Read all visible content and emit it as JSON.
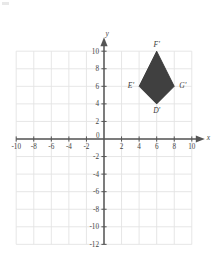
{
  "figure": {
    "corner_mark": "",
    "axes": {
      "x_axis_label": "x",
      "y_axis_label": "y",
      "origin_label": "0",
      "x_ticks": [
        -10,
        -8,
        -6,
        -4,
        -2,
        2,
        4,
        6,
        8,
        10
      ],
      "x_tick_labels": [
        "-10",
        "-8",
        "-6",
        "-4",
        "-2",
        "2",
        "4",
        "6",
        "8",
        "10"
      ],
      "y_ticks": [
        10,
        8,
        6,
        4,
        2,
        -2,
        -4,
        -6,
        -8,
        -10,
        -12
      ],
      "y_tick_labels": [
        "10",
        "8",
        "6",
        "4",
        "2",
        "-2",
        "-4",
        "-6",
        "-8",
        "-10",
        "-12"
      ],
      "xlim": [
        -10,
        10
      ],
      "ylim": [
        -12,
        10
      ],
      "grid": true,
      "grid_step": 2,
      "grid_color": "#e3e3e3",
      "axis_color": "#555555"
    },
    "shape": {
      "name": "kite",
      "fill_color": "#404040",
      "stroke_color": "#2e2e2e",
      "vertices": [
        {
          "label": "F'",
          "x": 6,
          "y": 10,
          "label_dx": 0,
          "label_dy": -4,
          "label_anchor": "middle"
        },
        {
          "label": "G'",
          "x": 8,
          "y": 6,
          "label_dx": 5,
          "label_dy": 2,
          "label_anchor": "start"
        },
        {
          "label": "D'",
          "x": 6,
          "y": 4,
          "label_dx": 0,
          "label_dy": 9,
          "label_anchor": "middle"
        },
        {
          "label": "E'",
          "x": 4,
          "y": 6,
          "label_dx": -5,
          "label_dy": 2,
          "label_anchor": "end"
        }
      ]
    }
  }
}
